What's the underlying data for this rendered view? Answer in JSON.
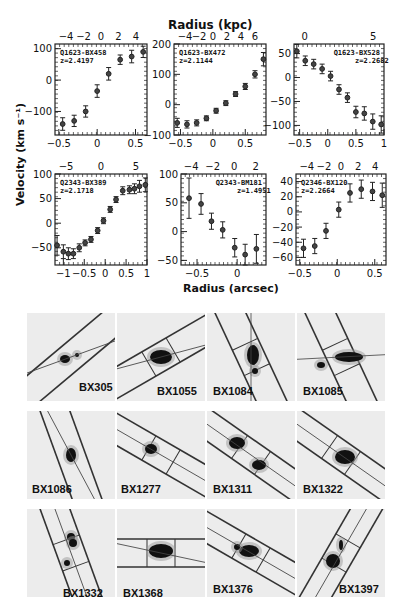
{
  "figure": {
    "top_axis_title": "Radius (kpc)",
    "bottom_axis_title": "Radius (arcsec)",
    "y_axis_title": "Velocity (km s⁻¹)"
  },
  "chart_data": [
    {
      "type": "scatter",
      "panel": "top-left",
      "name": "Q1623-BX458",
      "redshift": "z=2.4197",
      "x_bottom_ticks": [
        "-0.5",
        "0",
        "0.5"
      ],
      "x_top_ticks": [
        "-4",
        "-2",
        "0",
        "2",
        "4"
      ],
      "y_ticks": [
        "100",
        "0",
        "-100"
      ],
      "xlim": [
        -0.55,
        0.65
      ],
      "ylim": [
        -175,
        115
      ],
      "x": [
        -0.45,
        -0.3,
        -0.15,
        0.0,
        0.15,
        0.3,
        0.45,
        0.6
      ],
      "y": [
        -140,
        -130,
        -100,
        -35,
        20,
        65,
        75,
        90
      ],
      "err": [
        20,
        18,
        18,
        20,
        20,
        15,
        20,
        18
      ]
    },
    {
      "type": "scatter",
      "panel": "top-middle",
      "name": "Q1623-BX472",
      "redshift": "z=2.1144",
      "x_bottom_ticks": [
        "-0.5",
        "0",
        "0.5"
      ],
      "x_top_ticks": [
        "-4",
        "-2",
        "0",
        "2",
        "4",
        "6"
      ],
      "y_ticks": [
        "200",
        "100",
        "0",
        "-100"
      ],
      "xlim": [
        -0.6,
        0.82
      ],
      "ylim": [
        -100,
        200
      ],
      "x": [
        -0.55,
        -0.4,
        -0.25,
        -0.1,
        0.05,
        0.2,
        0.35,
        0.5,
        0.65,
        0.78
      ],
      "y": [
        -60,
        -65,
        -60,
        -45,
        -20,
        5,
        35,
        60,
        100,
        150
      ],
      "err": [
        15,
        12,
        10,
        8,
        8,
        8,
        8,
        10,
        12,
        22
      ]
    },
    {
      "type": "scatter",
      "panel": "top-right",
      "name": "Q1623-BX528",
      "redshift": "z=2.2682",
      "x_bottom_ticks": [
        "-0.5",
        "0",
        "0.5",
        "1"
      ],
      "x_top_ticks": [
        "0",
        "5"
      ],
      "y_ticks": [
        "50",
        "0",
        "-50",
        "-100"
      ],
      "xlim": [
        -0.6,
        1.0
      ],
      "ylim": [
        -120,
        70
      ],
      "x": [
        -0.55,
        -0.4,
        -0.25,
        -0.1,
        0.05,
        0.2,
        0.35,
        0.5,
        0.65,
        0.8,
        0.95
      ],
      "y": [
        55,
        35,
        28,
        18,
        3,
        -25,
        -42,
        -72,
        -75,
        -92,
        -98
      ],
      "err": [
        14,
        10,
        10,
        10,
        10,
        10,
        10,
        12,
        14,
        16,
        18
      ]
    },
    {
      "type": "scatter",
      "panel": "bottom-left",
      "name": "Q2343-BX389",
      "redshift": "z=2.1718",
      "x_bottom_ticks": [
        "-1",
        "-0.5",
        "0",
        "0.5",
        "1"
      ],
      "x_top_ticks": [
        "-5",
        "0",
        "5"
      ],
      "y_ticks": [
        "100",
        "50",
        "0",
        "-50"
      ],
      "xlim": [
        -1.2,
        1.0
      ],
      "ylim": [
        -85,
        100
      ],
      "x": [
        -1.15,
        -1.0,
        -0.88,
        -0.76,
        -0.62,
        -0.48,
        -0.34,
        -0.18,
        -0.04,
        0.12,
        0.26,
        0.42,
        0.58,
        0.7,
        0.82,
        0.96
      ],
      "y": [
        -45,
        -58,
        -62,
        -62,
        -50,
        -40,
        -33,
        -15,
        5,
        28,
        48,
        66,
        68,
        70,
        75,
        78
      ],
      "err": [
        20,
        14,
        12,
        10,
        8,
        6,
        6,
        6,
        6,
        6,
        6,
        8,
        8,
        10,
        12,
        14
      ]
    },
    {
      "type": "scatter",
      "panel": "bottom-middle",
      "name": "Q2343-BM181",
      "redshift": "z=1.4951",
      "x_bottom_ticks": [
        "-0.5",
        "0"
      ],
      "x_top_ticks": [
        "-4",
        "-2",
        "0",
        "2"
      ],
      "y_ticks": [
        "100",
        "50",
        "0",
        "-50"
      ],
      "xlim": [
        -0.7,
        0.36
      ],
      "ylim": [
        -58,
        100
      ],
      "x": [
        -0.6,
        -0.45,
        -0.32,
        -0.18,
        -0.03,
        0.1,
        0.24
      ],
      "y": [
        58,
        48,
        18,
        3,
        -28,
        -40,
        -30
      ],
      "err": [
        35,
        18,
        14,
        14,
        16,
        18,
        25
      ]
    },
    {
      "type": "scatter",
      "panel": "bottom-right",
      "name": "Q2346-BX120",
      "redshift": "z=2.2664",
      "x_bottom_ticks": [
        "-0.5",
        "0",
        "0.5"
      ],
      "x_top_ticks": [
        "-4",
        "-2",
        "0",
        "2",
        "4"
      ],
      "y_ticks": [
        "40",
        "20",
        "0",
        "-20",
        "-40",
        "-60"
      ],
      "xlim": [
        -0.55,
        0.65
      ],
      "ylim": [
        -70,
        50
      ],
      "x": [
        -0.45,
        -0.3,
        -0.15,
        0.02,
        0.17,
        0.32,
        0.47,
        0.6
      ],
      "y": [
        -48,
        -45,
        -25,
        3,
        25,
        30,
        27,
        22
      ],
      "err": [
        12,
        10,
        10,
        10,
        12,
        12,
        12,
        16
      ]
    }
  ],
  "stamps": [
    {
      "label": "BX305"
    },
    {
      "label": "BX1055"
    },
    {
      "label": "BX1084"
    },
    {
      "label": "BX1085"
    },
    {
      "label": "BX1086"
    },
    {
      "label": "BX1277"
    },
    {
      "label": "BX1311"
    },
    {
      "label": "BX1322"
    },
    {
      "label": "BX1332"
    },
    {
      "label": "BX1368"
    },
    {
      "label": "BX1376"
    },
    {
      "label": "BX1397"
    }
  ]
}
